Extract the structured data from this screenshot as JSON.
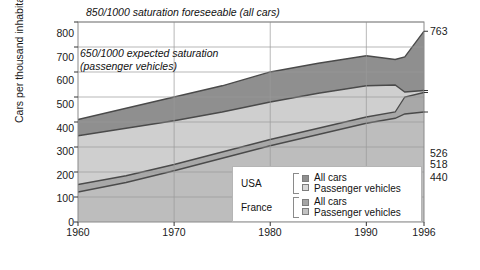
{
  "chart_data": {
    "type": "area",
    "title": "",
    "xlabel": "",
    "ylabel": "Cars per thousand inhabitants",
    "xlim": [
      1960,
      1996
    ],
    "ylim": [
      0,
      800
    ],
    "grid": true,
    "xticks": [
      1960,
      1970,
      1980,
      1990,
      1996
    ],
    "yticks": [
      0,
      100,
      200,
      300,
      400,
      500,
      600,
      700,
      800
    ],
    "x": [
      1960,
      1965,
      1970,
      1975,
      1980,
      1985,
      1990,
      1993,
      1994,
      1996
    ],
    "series": [
      {
        "name": "USA All cars",
        "country": "USA",
        "category": "All cars",
        "color": "#8f8f8f",
        "values": [
          410,
          455,
          500,
          545,
          600,
          635,
          665,
          650,
          660,
          763
        ],
        "end_value": 763
      },
      {
        "name": "USA Passenger vehicles",
        "country": "USA",
        "category": "Passenger vehicles",
        "color": "#cfcfcf",
        "values": [
          345,
          375,
          405,
          440,
          480,
          515,
          545,
          548,
          520,
          526
        ],
        "end_value": 526
      },
      {
        "name": "France All cars",
        "country": "France",
        "category": "All cars",
        "color": "#a8a8a8",
        "values": [
          150,
          185,
          230,
          280,
          330,
          375,
          420,
          440,
          500,
          518
        ],
        "end_value": 518
      },
      {
        "name": "France Passenger vehicles",
        "country": "France",
        "category": "Passenger vehicles",
        "color": "#bdbdbd",
        "values": [
          120,
          158,
          205,
          255,
          305,
          350,
          395,
          415,
          432,
          440
        ],
        "end_value": 440
      }
    ],
    "annotations": [
      {
        "id": "saturation-all-cars",
        "text": "850/1000 saturation foreseeable (all cars)"
      },
      {
        "id": "saturation-passenger",
        "line1": "650/1000 expected saturation",
        "line2": "(passenger vehicles)"
      }
    ],
    "end_labels": [
      {
        "value": "763",
        "y": 763
      },
      {
        "value": "526",
        "y": 526
      },
      {
        "value": "518",
        "y": 518
      },
      {
        "value": "440",
        "y": 440
      }
    ]
  },
  "legend": {
    "groups": [
      {
        "country": "USA",
        "items": [
          {
            "label": "All cars",
            "color": "#8f8f8f"
          },
          {
            "label": "Passenger vehicles",
            "color": "#d8d8d8"
          }
        ]
      },
      {
        "country": "France",
        "items": [
          {
            "label": "All cars",
            "color": "#a5a5a5"
          },
          {
            "label": "Passenger vehicles",
            "color": "#c2c2c2"
          }
        ]
      }
    ]
  }
}
